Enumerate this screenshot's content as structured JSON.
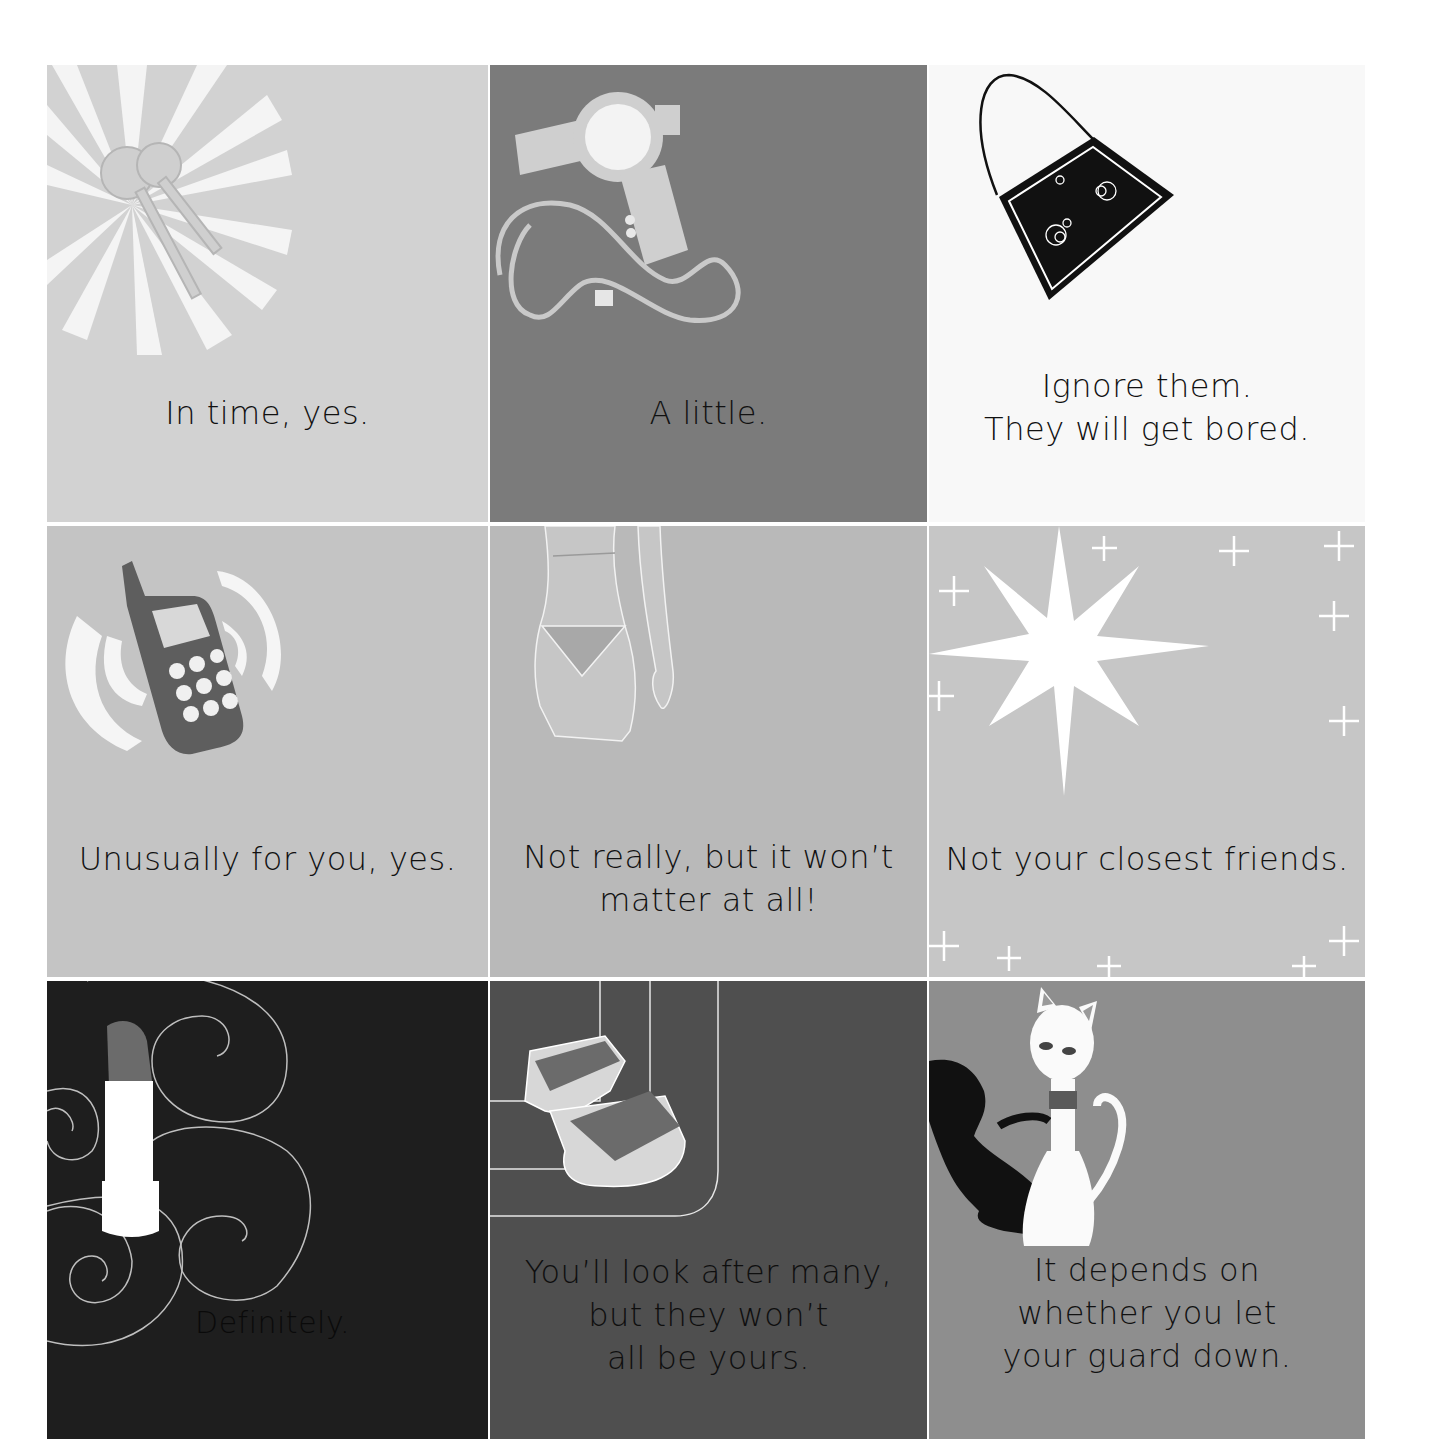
{
  "tiles": [
    {
      "caption": "In time, yes.",
      "icon": "keys-icon",
      "bg": "#d2d2d2"
    },
    {
      "caption": "A little.",
      "icon": "hair-dryer-icon",
      "bg": "#7b7b7b"
    },
    {
      "caption": "Ignore them.\nThey will get bored.",
      "icon": "handbag-icon",
      "bg": "#f8f8f8"
    },
    {
      "caption": "Unusually for you, yes.",
      "icon": "mobile-phone-icon",
      "bg": "#c4c4c4"
    },
    {
      "caption": "Not really, but it won’t\nmatter at all!",
      "icon": "bikini-figure-icon",
      "bg": "#b9b9b9"
    },
    {
      "caption": "Not your closest friends.",
      "icon": "sparkle-star-icon",
      "bg": "#c6c6c6"
    },
    {
      "caption": "Definitely.",
      "icon": "lipstick-icon",
      "bg": "#1e1e1e"
    },
    {
      "caption": "You’ll look after many,\nbut they won’t\nall be yours.",
      "icon": "sandal-icon",
      "bg": "#4f4f4f"
    },
    {
      "caption": "It depends on\nwhether you let\nyour guard down.",
      "icon": "cat-icon",
      "bg": "#8e8e8e"
    }
  ]
}
